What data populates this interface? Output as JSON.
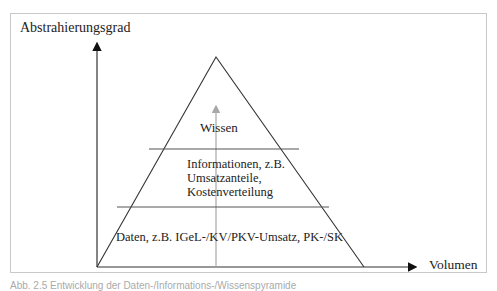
{
  "diagram": {
    "type": "pyramid",
    "axes": {
      "y_label": "Abstrahierungsgrad",
      "x_label": "Volumen"
    },
    "tiers": [
      {
        "level": "top",
        "text": "Wissen"
      },
      {
        "level": "middle",
        "lines": [
          "Informationen, z.B.",
          "Umsatzanteile,",
          "Kostenverteilung"
        ]
      },
      {
        "level": "bottom",
        "text": "Daten, z.B. IGeL-/KV/PKV-Umsatz, PK-/SK"
      }
    ],
    "caption": "Abb. 2.5 Entwicklung der Daten-/Informations-/Wissenspyramide"
  },
  "colors": {
    "lines": "#333333",
    "center_arrow": "#a8a8a8",
    "frame": "#c8c8c8"
  }
}
